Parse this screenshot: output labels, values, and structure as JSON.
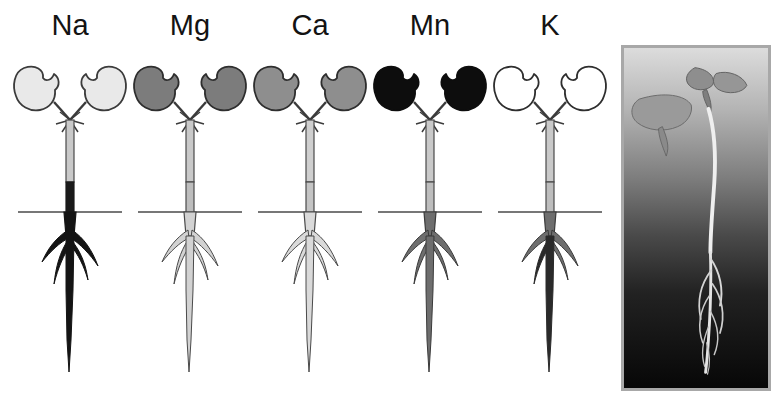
{
  "figure": {
    "type": "scientific-figure",
    "caption_present": false,
    "background_color": "#ffffff",
    "width": 781,
    "height": 406
  },
  "panels": [
    {
      "id": "panel-na",
      "label": "Na",
      "x": 10,
      "width": 120,
      "cotyledon_fill": "#e9e9e9",
      "cotyledon_shade_name": "very-light-gray",
      "hypocotyl_upper_fill": "#c9c9c9",
      "hypocotyl_lower_fill": "#1a1a1a",
      "root_fill": "#141414",
      "root_shade_name": "black",
      "soil_line": true
    },
    {
      "id": "panel-mg",
      "label": "Mg",
      "x": 130,
      "width": 120,
      "cotyledon_fill": "#7c7c7c",
      "cotyledon_shade_name": "dark-gray",
      "hypocotyl_upper_fill": "#c9c9c9",
      "hypocotyl_lower_fill": "#bdbdbd",
      "root_fill": "#d2d2d2",
      "root_shade_name": "light-gray",
      "soil_line": true
    },
    {
      "id": "panel-ca",
      "label": "Ca",
      "x": 250,
      "width": 120,
      "cotyledon_fill": "#8e8e8e",
      "cotyledon_shade_name": "medium-gray",
      "hypocotyl_upper_fill": "#cfcfcf",
      "hypocotyl_lower_fill": "#c4c4c4",
      "root_fill": "#dadada",
      "root_shade_name": "very-light-gray",
      "soil_line": true
    },
    {
      "id": "panel-mn",
      "label": "Mn",
      "x": 370,
      "width": 120,
      "cotyledon_fill": "#0d0d0d",
      "cotyledon_shade_name": "black",
      "hypocotyl_upper_fill": "#c9c9c9",
      "hypocotyl_lower_fill": "#bdbdbd",
      "root_fill": "#6e6e6e",
      "root_shade_name": "gray",
      "soil_line": true
    },
    {
      "id": "panel-k",
      "label": "K",
      "x": 490,
      "width": 120,
      "cotyledon_fill": "#ffffff",
      "cotyledon_shade_name": "white-unfilled",
      "hypocotyl_upper_fill": "#c9c9c9",
      "hypocotyl_lower_fill": "#bdbdbd",
      "root_fill": "#6e6e6e",
      "root_shade_name": "gray",
      "soil_line": true
    }
  ],
  "photo": {
    "id": "seedling-photograph",
    "alt_name": "seedling-photo",
    "x": 621,
    "y": 45,
    "width": 150,
    "height": 346,
    "border_color": "#a8a8a8",
    "background_gradient_top": "#d9d9d9",
    "background_gradient_bottom": "#080808",
    "subject": "seedling with cotyledons, first true leaves, hypocotyl and branched root system"
  }
}
